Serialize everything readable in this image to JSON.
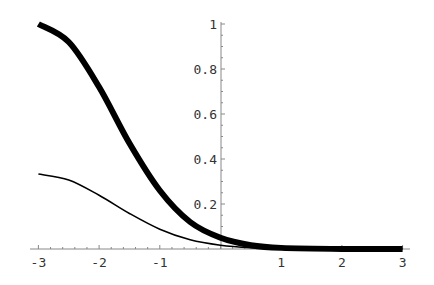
{
  "chart_data": {
    "type": "line",
    "title": "",
    "xlabel": "",
    "ylabel": "",
    "xlim": [
      -3,
      3
    ],
    "ylim": [
      0,
      1
    ],
    "grid": false,
    "legend": null,
    "x_ticks": [
      "-3",
      "-2",
      "-1",
      "1",
      "2",
      "3"
    ],
    "y_ticks": [
      "0.2",
      "0.4",
      "0.6",
      "0.8",
      "1"
    ],
    "x": [
      -3,
      -2.5,
      -2,
      -1.5,
      -1,
      -0.5,
      0,
      0.5,
      1,
      2,
      3
    ],
    "series": [
      {
        "name": "thick curve",
        "style": "thick",
        "values": [
          1.0,
          0.92,
          0.72,
          0.47,
          0.26,
          0.12,
          0.05,
          0.017,
          0.005,
          0.0002,
          0.0
        ]
      },
      {
        "name": "thin curve",
        "style": "thin",
        "values": [
          0.333,
          0.307,
          0.239,
          0.158,
          0.088,
          0.041,
          0.017,
          0.006,
          0.002,
          0.0001,
          0.0
        ]
      }
    ]
  },
  "axes": {
    "x_tick_labels": [
      "-3",
      "-2",
      "-1",
      "1",
      "2",
      "3"
    ],
    "y_tick_labels": [
      "1",
      "0.8",
      "0.6",
      "0.4",
      "0.2"
    ]
  },
  "colors": {
    "curve": "#000000",
    "axis": "#888888",
    "label": "#333333"
  }
}
